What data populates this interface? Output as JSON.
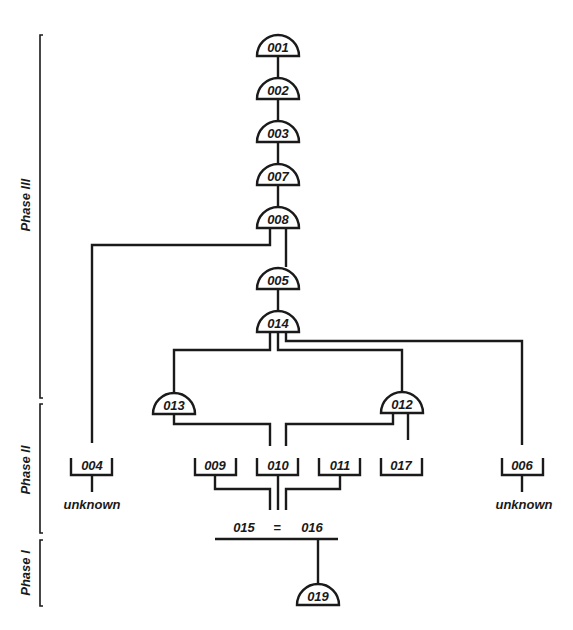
{
  "phases": [
    {
      "id": "phase3",
      "label": "Phase III"
    },
    {
      "id": "phase2",
      "label": "Phase II"
    },
    {
      "id": "phase1",
      "label": "Phase I"
    }
  ],
  "arc_nodes": {
    "n001": "001",
    "n002": "002",
    "n003": "003",
    "n007": "007",
    "n008": "008",
    "n005": "005",
    "n014": "014",
    "n013": "013",
    "n012": "012",
    "n019": "019"
  },
  "box_nodes": {
    "n004": "004",
    "n009": "009",
    "n010": "010",
    "n011": "011",
    "n017": "017",
    "n006": "006"
  },
  "unknown_labels": {
    "left": "unknown",
    "right": "unknown"
  },
  "equivalence": {
    "left": "015",
    "symbol": "=",
    "right": "016"
  },
  "colors": {
    "ink": "#1a1a1a",
    "background": "#ffffff"
  }
}
